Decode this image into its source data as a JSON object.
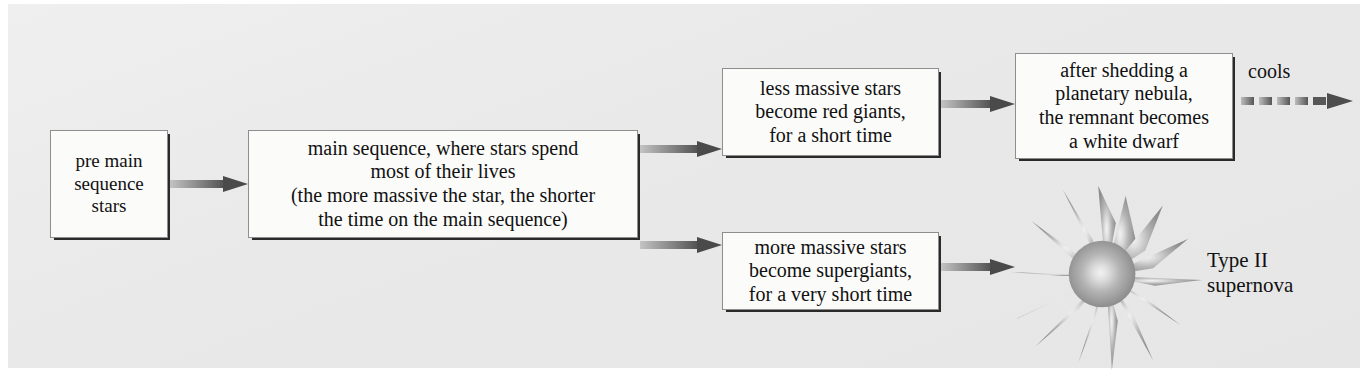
{
  "diagram": {
    "background_color": "#e9e9e9",
    "box_fill": "#fbfbfa",
    "box_border": "#8e8e8e",
    "text_color": "#111111",
    "arrow_color_start": "#b9b9b9",
    "arrow_color_end": "#4a4a4a"
  },
  "nodes": [
    {
      "id": "pre_main_sequence",
      "text": "pre main\nsequence\nstars"
    },
    {
      "id": "main_sequence",
      "text": "main sequence, where stars spend\nmost of their lives\n(the more massive the star, the shorter\nthe time on the main sequence)"
    },
    {
      "id": "red_giants",
      "text": "less massive stars\nbecome red giants,\nfor a short time"
    },
    {
      "id": "supergiants",
      "text": "more massive stars\nbecome supergiants,\nfor a very short time"
    },
    {
      "id": "white_dwarf",
      "text": "after shedding a\nplanetary nebula,\nthe remnant becomes\na white dwarf"
    }
  ],
  "edges": [
    {
      "id": "e1",
      "from": "pre_main_sequence",
      "to": "main_sequence",
      "style": "solid",
      "label": ""
    },
    {
      "id": "e2",
      "from": "main_sequence",
      "to": "red_giants",
      "style": "solid",
      "label": ""
    },
    {
      "id": "e3",
      "from": "main_sequence",
      "to": "supergiants",
      "style": "solid",
      "label": ""
    },
    {
      "id": "e4",
      "from": "red_giants",
      "to": "white_dwarf",
      "style": "solid",
      "label": ""
    },
    {
      "id": "e5",
      "from": "supergiants",
      "to": "supernova",
      "style": "solid",
      "label": ""
    },
    {
      "id": "e6",
      "from": "white_dwarf",
      "to": "",
      "style": "dashed",
      "label": "cools"
    }
  ],
  "labels": {
    "cools": "cools",
    "supernova": "Type II\nsupernova"
  },
  "graphics": {
    "supernova_burst": "starburst-icon"
  }
}
